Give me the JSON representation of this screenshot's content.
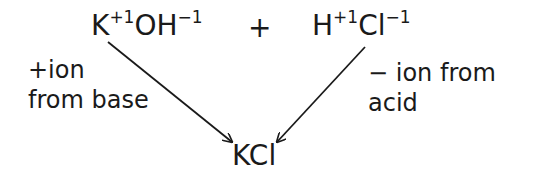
{
  "reactants": [
    {
      "base1": "K",
      "charge1": "+1",
      "base2": "OH",
      "charge2": "−1"
    },
    {
      "base1": "H",
      "charge1": "+1",
      "base2": "Cl",
      "charge2": "−1"
    }
  ],
  "operator": "+",
  "product": "KCl",
  "annotations": {
    "left": [
      "+ion",
      "from base"
    ],
    "right": [
      "− ion from",
      "acid"
    ]
  },
  "arrows": [
    {
      "from": "K",
      "to": "KCl",
      "x1": 108,
      "y1": 42,
      "x2": 232,
      "y2": 142
    },
    {
      "from": "Cl",
      "to": "KCl",
      "x1": 365,
      "y1": 47,
      "x2": 277,
      "y2": 142
    }
  ]
}
